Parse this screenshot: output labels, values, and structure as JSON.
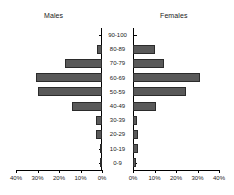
{
  "chart_data": {
    "type": "bar",
    "subtype": "population-pyramid",
    "title": "",
    "xlabel": "",
    "ylabel": "",
    "grid": false,
    "legend": "none",
    "categories": [
      "90-100",
      "80-89",
      "70-79",
      "60-69",
      "50-59",
      "40-49",
      "30-39",
      "20-29",
      "10-19",
      "0-9"
    ],
    "axis_max_percent": 40,
    "xtick_labels_left": [
      "40%",
      "30%",
      "20%",
      "10%",
      "0%"
    ],
    "xtick_labels_right": [
      "0%",
      "10%",
      "20%",
      "30%",
      "40%"
    ],
    "xtick_values": [
      40,
      30,
      20,
      10,
      0
    ],
    "series": [
      {
        "name": "Males",
        "side": "left",
        "values": [
          0,
          2.5,
          17.0,
          30.5,
          30.0,
          14.0,
          3.0,
          3.0,
          0.5,
          1.0
        ]
      },
      {
        "name": "Females",
        "side": "right",
        "values": [
          0,
          10.0,
          14.5,
          31.0,
          24.5,
          10.5,
          2.0,
          2.5,
          2.5,
          1.5
        ]
      }
    ],
    "colors": {
      "bar_fill": "#595959",
      "bar_edge": "#2b2b2b",
      "axis": "#000000",
      "text": "#1a1a1a",
      "background": "#ffffff"
    }
  },
  "panels": {
    "left_title": "Males",
    "right_title": "Females"
  }
}
